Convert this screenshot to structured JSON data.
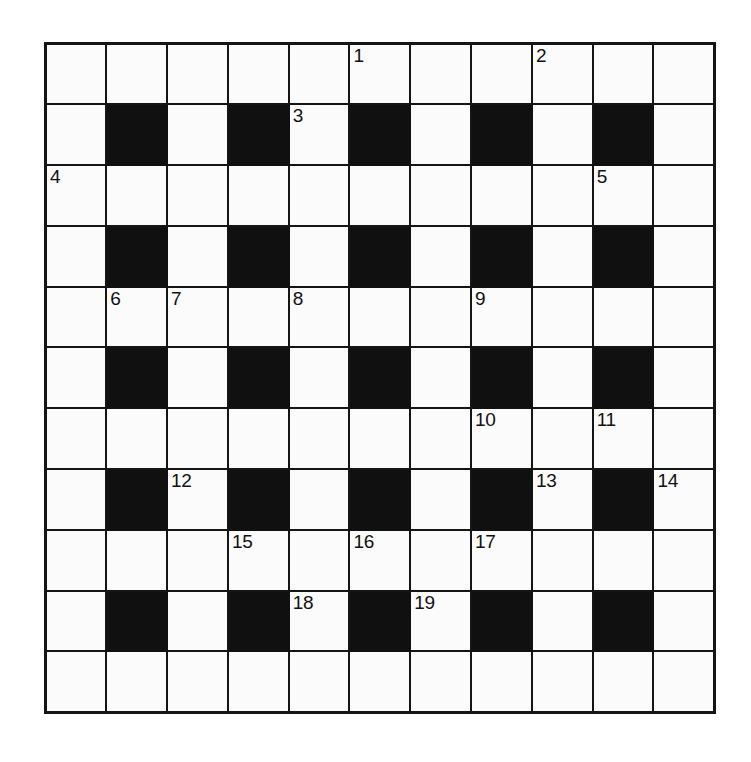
{
  "puzzle": {
    "type": "crossword-grid",
    "title": "Crossword Puzzle Grid",
    "rows": 11,
    "columns": 11,
    "cell_size_px": 61,
    "colors": {
      "background": "#ffffff",
      "cell_fill": "#fbfbfb",
      "block_fill": "#101010",
      "border": "#151515",
      "number_text": "#111111"
    },
    "total_clue_numbers": 19,
    "numbers_visible": [
      "1",
      "2",
      "3",
      "4",
      "5",
      "6",
      "7",
      "8",
      "9",
      "10",
      "11",
      "12",
      "13",
      "14",
      "15",
      "16",
      "17",
      "18",
      "19"
    ],
    "grid": [
      [
        {
          "block": false,
          "number": "",
          "letter": ""
        },
        {
          "block": false,
          "number": "",
          "letter": ""
        },
        {
          "block": false,
          "number": "",
          "letter": ""
        },
        {
          "block": false,
          "number": "",
          "letter": ""
        },
        {
          "block": false,
          "number": "",
          "letter": ""
        },
        {
          "block": false,
          "number": "1",
          "letter": ""
        },
        {
          "block": false,
          "number": "",
          "letter": ""
        },
        {
          "block": false,
          "number": "",
          "letter": ""
        },
        {
          "block": false,
          "number": "2",
          "letter": ""
        },
        {
          "block": false,
          "number": "",
          "letter": ""
        },
        {
          "block": false,
          "number": "",
          "letter": ""
        }
      ],
      [
        {
          "block": false,
          "number": "",
          "letter": ""
        },
        {
          "block": true,
          "number": "",
          "letter": ""
        },
        {
          "block": false,
          "number": "",
          "letter": ""
        },
        {
          "block": true,
          "number": "",
          "letter": ""
        },
        {
          "block": false,
          "number": "3",
          "letter": ""
        },
        {
          "block": true,
          "number": "",
          "letter": ""
        },
        {
          "block": false,
          "number": "",
          "letter": ""
        },
        {
          "block": true,
          "number": "",
          "letter": ""
        },
        {
          "block": false,
          "number": "",
          "letter": ""
        },
        {
          "block": true,
          "number": "",
          "letter": ""
        },
        {
          "block": false,
          "number": "",
          "letter": ""
        }
      ],
      [
        {
          "block": false,
          "number": "4",
          "letter": ""
        },
        {
          "block": false,
          "number": "",
          "letter": ""
        },
        {
          "block": false,
          "number": "",
          "letter": ""
        },
        {
          "block": false,
          "number": "",
          "letter": ""
        },
        {
          "block": false,
          "number": "",
          "letter": ""
        },
        {
          "block": false,
          "number": "",
          "letter": ""
        },
        {
          "block": false,
          "number": "",
          "letter": ""
        },
        {
          "block": false,
          "number": "",
          "letter": ""
        },
        {
          "block": false,
          "number": "",
          "letter": ""
        },
        {
          "block": false,
          "number": "5",
          "letter": ""
        },
        {
          "block": false,
          "number": "",
          "letter": ""
        }
      ],
      [
        {
          "block": false,
          "number": "",
          "letter": ""
        },
        {
          "block": true,
          "number": "",
          "letter": ""
        },
        {
          "block": false,
          "number": "",
          "letter": ""
        },
        {
          "block": true,
          "number": "",
          "letter": ""
        },
        {
          "block": false,
          "number": "",
          "letter": ""
        },
        {
          "block": true,
          "number": "",
          "letter": ""
        },
        {
          "block": false,
          "number": "",
          "letter": ""
        },
        {
          "block": true,
          "number": "",
          "letter": ""
        },
        {
          "block": false,
          "number": "",
          "letter": ""
        },
        {
          "block": true,
          "number": "",
          "letter": ""
        },
        {
          "block": false,
          "number": "",
          "letter": ""
        }
      ],
      [
        {
          "block": false,
          "number": "",
          "letter": ""
        },
        {
          "block": false,
          "number": "6",
          "letter": ""
        },
        {
          "block": false,
          "number": "7",
          "letter": ""
        },
        {
          "block": false,
          "number": "",
          "letter": ""
        },
        {
          "block": false,
          "number": "8",
          "letter": ""
        },
        {
          "block": false,
          "number": "",
          "letter": ""
        },
        {
          "block": false,
          "number": "",
          "letter": ""
        },
        {
          "block": false,
          "number": "9",
          "letter": ""
        },
        {
          "block": false,
          "number": "",
          "letter": ""
        },
        {
          "block": false,
          "number": "",
          "letter": ""
        },
        {
          "block": false,
          "number": "",
          "letter": ""
        }
      ],
      [
        {
          "block": false,
          "number": "",
          "letter": ""
        },
        {
          "block": true,
          "number": "",
          "letter": ""
        },
        {
          "block": false,
          "number": "",
          "letter": ""
        },
        {
          "block": true,
          "number": "",
          "letter": ""
        },
        {
          "block": false,
          "number": "",
          "letter": ""
        },
        {
          "block": true,
          "number": "",
          "letter": ""
        },
        {
          "block": false,
          "number": "",
          "letter": ""
        },
        {
          "block": true,
          "number": "",
          "letter": ""
        },
        {
          "block": false,
          "number": "",
          "letter": ""
        },
        {
          "block": true,
          "number": "",
          "letter": ""
        },
        {
          "block": false,
          "number": "",
          "letter": ""
        }
      ],
      [
        {
          "block": false,
          "number": "",
          "letter": ""
        },
        {
          "block": false,
          "number": "",
          "letter": ""
        },
        {
          "block": false,
          "number": "",
          "letter": ""
        },
        {
          "block": false,
          "number": "",
          "letter": ""
        },
        {
          "block": false,
          "number": "",
          "letter": ""
        },
        {
          "block": false,
          "number": "",
          "letter": ""
        },
        {
          "block": false,
          "number": "",
          "letter": ""
        },
        {
          "block": false,
          "number": "10",
          "letter": ""
        },
        {
          "block": false,
          "number": "",
          "letter": ""
        },
        {
          "block": false,
          "number": "11",
          "letter": ""
        },
        {
          "block": false,
          "number": "",
          "letter": ""
        }
      ],
      [
        {
          "block": false,
          "number": "",
          "letter": ""
        },
        {
          "block": true,
          "number": "",
          "letter": ""
        },
        {
          "block": false,
          "number": "12",
          "letter": ""
        },
        {
          "block": true,
          "number": "",
          "letter": ""
        },
        {
          "block": false,
          "number": "",
          "letter": ""
        },
        {
          "block": true,
          "number": "",
          "letter": ""
        },
        {
          "block": false,
          "number": "",
          "letter": ""
        },
        {
          "block": true,
          "number": "",
          "letter": ""
        },
        {
          "block": false,
          "number": "13",
          "letter": ""
        },
        {
          "block": true,
          "number": "",
          "letter": ""
        },
        {
          "block": false,
          "number": "14",
          "letter": ""
        }
      ],
      [
        {
          "block": false,
          "number": "",
          "letter": ""
        },
        {
          "block": false,
          "number": "",
          "letter": ""
        },
        {
          "block": false,
          "number": "",
          "letter": ""
        },
        {
          "block": false,
          "number": "15",
          "letter": ""
        },
        {
          "block": false,
          "number": "",
          "letter": ""
        },
        {
          "block": false,
          "number": "16",
          "letter": ""
        },
        {
          "block": false,
          "number": "",
          "letter": ""
        },
        {
          "block": false,
          "number": "17",
          "letter": ""
        },
        {
          "block": false,
          "number": "",
          "letter": ""
        },
        {
          "block": false,
          "number": "",
          "letter": ""
        },
        {
          "block": false,
          "number": "",
          "letter": ""
        }
      ],
      [
        {
          "block": false,
          "number": "",
          "letter": ""
        },
        {
          "block": true,
          "number": "",
          "letter": ""
        },
        {
          "block": false,
          "number": "",
          "letter": ""
        },
        {
          "block": true,
          "number": "",
          "letter": ""
        },
        {
          "block": false,
          "number": "18",
          "letter": ""
        },
        {
          "block": true,
          "number": "",
          "letter": ""
        },
        {
          "block": false,
          "number": "19",
          "letter": ""
        },
        {
          "block": true,
          "number": "",
          "letter": ""
        },
        {
          "block": false,
          "number": "",
          "letter": ""
        },
        {
          "block": true,
          "number": "",
          "letter": ""
        },
        {
          "block": false,
          "number": "",
          "letter": ""
        }
      ],
      [
        {
          "block": false,
          "number": "",
          "letter": ""
        },
        {
          "block": false,
          "number": "",
          "letter": ""
        },
        {
          "block": false,
          "number": "",
          "letter": ""
        },
        {
          "block": false,
          "number": "",
          "letter": ""
        },
        {
          "block": false,
          "number": "",
          "letter": ""
        },
        {
          "block": false,
          "number": "",
          "letter": ""
        },
        {
          "block": false,
          "number": "",
          "letter": ""
        },
        {
          "block": false,
          "number": "",
          "letter": ""
        },
        {
          "block": false,
          "number": "",
          "letter": ""
        },
        {
          "block": false,
          "number": "",
          "letter": ""
        },
        {
          "block": false,
          "number": "",
          "letter": ""
        }
      ]
    ]
  }
}
